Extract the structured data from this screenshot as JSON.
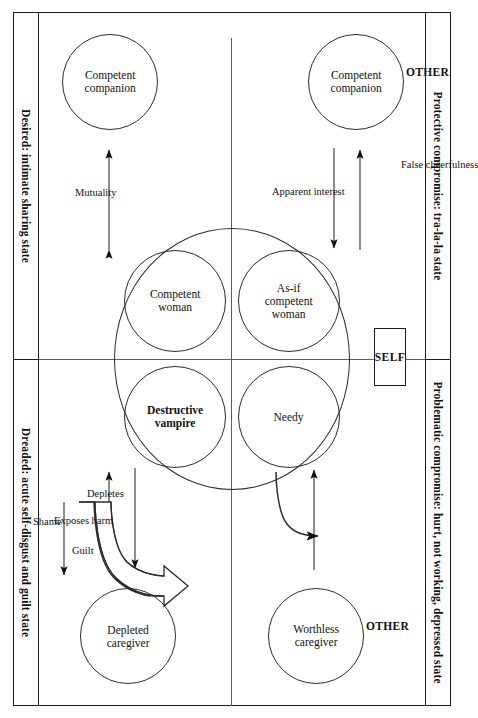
{
  "diagram": {
    "quadrants": {
      "top_left": "Protective compromise: tra-la-la state",
      "bottom_left": "Problematic compromise: hurt, not working, depressed state",
      "top_right": "Desired: intimate sharing state",
      "bottom_right": "Dreaded: acute self-disgust and guilt state"
    },
    "axis_labels": {
      "self": "SELF",
      "other_upper": "OTHER",
      "other_lower": "OTHER"
    },
    "self_circles": [
      {
        "id": "as-if-competent-woman",
        "label_line1": "As-if",
        "label_line2": "competent",
        "label_line3": "woman"
      },
      {
        "id": "competent-woman",
        "label_line1": "Competent",
        "label_line2": "woman"
      },
      {
        "id": "needy",
        "label_line1": "Needy",
        "label_line2": ""
      },
      {
        "id": "destructive-vampire",
        "label_line1": "Destructive",
        "label_line2": "vampire"
      }
    ],
    "other_circles": [
      {
        "id": "competent-companion-upper",
        "label_line1": "Competent",
        "label_line2": "companion"
      },
      {
        "id": "competent-companion-lower",
        "label_line1": "Competent",
        "label_line2": "companion"
      },
      {
        "id": "worthless-caregiver",
        "label_line1": "Worthless",
        "label_line2": "caregiver"
      },
      {
        "id": "depleted-caregiver",
        "label_line1": "Depleted",
        "label_line2": "caregiver"
      }
    ],
    "arrows": [
      {
        "id": "false-cheerfulness",
        "label": "False cheerfulness"
      },
      {
        "id": "apparent-interest",
        "label": "Apparent interest"
      },
      {
        "id": "mutuality",
        "label": "Mutuality"
      },
      {
        "id": "depletes",
        "label": "Depletes"
      },
      {
        "id": "exposes-harm",
        "label": "Exposes harm"
      },
      {
        "id": "shame",
        "label": "Shame"
      },
      {
        "id": "guilt",
        "label": "Guilt"
      }
    ],
    "colors": {
      "line": "#2b2b2b",
      "frame": "#1a1a1a",
      "quadrant_divider": "#5d5d5d",
      "guilt_arrow_fill": "#808080",
      "background": "#ffffff"
    }
  }
}
